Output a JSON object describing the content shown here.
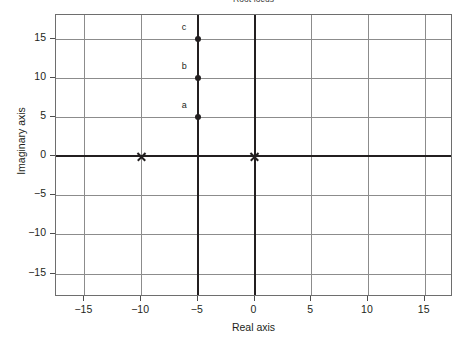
{
  "chart_data": {
    "type": "scatter",
    "title": "Root locus",
    "xlabel": "Real axis",
    "ylabel": "Imaginary axis",
    "xlim": [
      -17.5,
      17.5
    ],
    "ylim": [
      -18.0,
      18.0
    ],
    "grid": true,
    "legend": "none",
    "xticks": [
      -15,
      -10,
      -5,
      0,
      5,
      10,
      15
    ],
    "xticklabels": [
      "−15",
      "−10",
      "−5",
      "0",
      "5",
      "10",
      "15"
    ],
    "yticks": [
      15,
      10,
      5,
      0,
      -5,
      -10,
      -15
    ],
    "yticklabels": [
      "15",
      "10",
      "5",
      "0",
      "−5",
      "−10",
      "−15"
    ],
    "poles": [
      {
        "marker": "x",
        "x": -10,
        "y": 0
      },
      {
        "marker": "x",
        "x": 0,
        "y": 0
      }
    ],
    "zeros": [],
    "branches": [
      {
        "name": "real-axis-segment",
        "description": "locus on real axis between the two poles",
        "points": [
          {
            "x": -10,
            "y": 0
          },
          {
            "x": 0,
            "y": 0
          }
        ]
      },
      {
        "name": "vertical-asymptote-branch",
        "description": "locus departs perpendicular at centroid Re = -5 and runs to ± infinity",
        "points": [
          {
            "x": -5,
            "y": -18
          },
          {
            "x": -5,
            "y": 18
          }
        ]
      }
    ],
    "labeled_points": [
      {
        "label": "a",
        "x": -5,
        "y": 5
      },
      {
        "label": "b",
        "x": -5,
        "y": 10
      },
      {
        "label": "c",
        "x": -5,
        "y": 15
      }
    ]
  }
}
